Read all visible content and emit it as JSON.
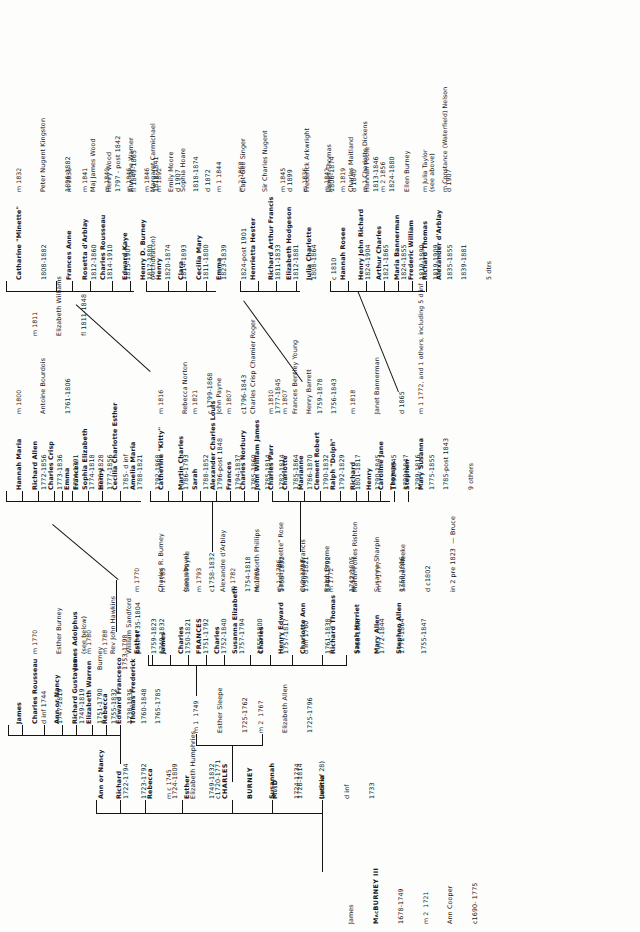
{
  "document": {
    "kind": "genealogical-chart",
    "family": "Burney / MacBurney",
    "orientation": "rotated-90-ccw"
  },
  "root": {
    "name": "James",
    "surname": "MacBURNEY III",
    "dates": "1678-1749",
    "marriage": "m 2  1721",
    "spouse": "Ann Cooper",
    "spouse_dates": "c1690- 1775"
  },
  "gen1": [
    {
      "name": "Letitia",
      "dates": "1733",
      "note": "d inf"
    },
    {
      "name": "Susannah",
      "dates": "1724-1734",
      "note": "(twin of 28)"
    },
    {
      "name": "CHARLES",
      "name2": "BURNEY",
      "name3": "MusD",
      "dates": "1726-1814",
      "smallcaps": true
    },
    {
      "name": "Esther",
      "dates": "1749-1832"
    },
    {
      "name": "Rebecca",
      "dates": "1724-1809"
    },
    {
      "name": "Richard",
      "dates": "1723-1792",
      "marriage": "m c 1745",
      "spouse": "Elizabeth Humphries",
      "spouse_dates": "c1720-1771"
    },
    {
      "name": "Ann or Nancy",
      "dates": "1722-1794"
    }
  ],
  "gen2": [
    {
      "marriage": "m 2  1767",
      "spouse": "Elizabeth Allen",
      "spouse_dates": "1725-1796"
    },
    {
      "marriage": "m 1  1749",
      "spouse": "Esther Sleepe",
      "spouse_dates": "1725-1762"
    }
  ],
  "gen3_left": [
    {
      "name": "Sarah Harriet",
      "dates": "1772-1844"
    },
    {
      "name": "Richard Thomas",
      "dates": "1768-1808"
    },
    {
      "name": "Charlotte Ann",
      "dates": "1761-1838"
    },
    {
      "name": "Henry Edward",
      "dates": "1757-1817",
      "note": "d inf 1760"
    },
    {
      "name": "Charles",
      "dates": "1757-1817"
    },
    {
      "name": "Susanna Elizabeth",
      "dates": "1755-1800"
    },
    {
      "name": "Charles",
      "dates": "1757-1794"
    },
    {
      "name": "FRANCES",
      "dates": "1752-1840",
      "smallcaps": true
    },
    {
      "name": "Charles",
      "dates": "1751-1792"
    },
    {
      "name": "James",
      "dates": "1750-1821"
    },
    {
      "name": "Esther",
      "dates": "1749-1832"
    }
  ],
  "gen3_marriages": [
    {
      "marriage": "m 2  1798",
      "spouse": "Ralph Broome",
      "spouse_dates": "1742-1805"
    },
    {
      "marriage": "m 1  1786",
      "spouse": "Clement Francis",
      "spouse_dates": "1744-1792"
    },
    {
      "marriage": "m 1785",
      "spouse": "Sarah \"Rosette\" Rose",
      "spouse_dates": "1759-1821"
    },
    {
      "marriage": "m 1782",
      "spouse": "Molesworth Phillips",
      "spouse_dates": "1755-1832"
    },
    {
      "marriage": "m 1793",
      "spouse": "Alexandre d'Arblay",
      "spouse_dates": "1754-1818"
    },
    {
      "marriage": "m 1785",
      "spouse": "Sarah Payne",
      "spouse_dates": "c1758-1832"
    },
    {
      "marriage": "m 1770",
      "spouse": "Charles R. Burney",
      "spouse_dates": "(see above)"
    }
  ],
  "gen_mid_left": [
    {
      "name": "Thomas Frederick",
      "dates": "1765-1785"
    },
    {
      "name": "Edward Francesco",
      "dates": "1760-1848"
    },
    {
      "name": "Rebecca",
      "dates": "1738-1835"
    },
    {
      "name": "Elizabeth Warren",
      "dates": "1755-1832"
    },
    {
      "name": "Richard Gustavus",
      "dates": "1751-1790"
    },
    {
      "name": "Ann or Nancy",
      "dates": "1749-1819"
    },
    {
      "name": "Charles Rousseau",
      "dates": "1747-1819"
    },
    {
      "name": "James",
      "note": "d inf 1744"
    }
  ],
  "gen_mid_left_marriages": [
    {
      "marriage": "m 1788",
      "spouse": "William Sandford",
      "spouse_dates": "1759-1823"
    },
    {
      "marriage": "m 1780",
      "spouse": "Rev John Hawkins",
      "spouse_dates": "post 1735-1804"
    },
    {
      "marriage": "m 1770",
      "spouse": "Esther Burney",
      "spouse_dates": "(see below)"
    },
    {
      "marriage": "",
      "spouse": "James Adolphus",
      "spouse_dates": "1753-1798",
      "extra": "Burney"
    }
  ],
  "gen4": [
    {
      "name": "Mary Allen",
      "dates": "1772-1864"
    },
    {
      "name": "Stephen Allen",
      "dates": "1755-1847"
    },
    {
      "name": "Amelia Maria",
      "dates": "1792-1868"
    },
    {
      "name": "Cecilia Charlotte Esther",
      "dates": "1788-1821"
    },
    {
      "name": "Henry",
      "dates": "1785- d inf"
    },
    {
      "name": "Sophia Elizabeth",
      "dates": "1777-1856"
    },
    {
      "name": "Frances",
      "dates": "1776-1828"
    },
    {
      "name": "Charles Parr",
      "dates": "1785-1864"
    },
    {
      "name": "Charlotte",
      "dates": "1786-1870"
    },
    {
      "name": "Marianne",
      "dates": "1790-1832"
    },
    {
      "name": "Clement Robert",
      "dates": "1792-1829"
    },
    {
      "name": "Ralph \"Dolph\"",
      "dates": "1801-1817"
    },
    {
      "name": "Richard",
      "dates": "1790-1845"
    },
    {
      "name": "Henry",
      "dates": "1792-1845"
    },
    {
      "name": "Caroline Jane",
      "dates": "1790-1847"
    },
    {
      "name": "Thomas",
      "dates": "1799-1816"
    },
    {
      "name": "Stephen",
      "dates": "1775-1855"
    },
    {
      "name": "Mary Susanna",
      "dates": "1785-post 1843"
    },
    {
      "name": "Sarah",
      "dates": "1796-post 1848"
    },
    {
      "name": "Martin Charles",
      "dates": "1788-1852"
    },
    {
      "name": "Alexander Charles Louis",
      "dates": "1794-1837"
    },
    {
      "name": "Frances",
      "dates": "1785-1860"
    },
    {
      "name": "Charles Norbury",
      "dates": "1785-1814"
    },
    {
      "name": "John William James",
      "dates": "1782-1814"
    },
    {
      "name": "Catherine \"Kitty\"",
      "dates": "1786-1793"
    },
    {
      "name": "Hannah Maria",
      "dates": "1772-1856"
    },
    {
      "name": "Richard Allen",
      "dates": "1773-1836"
    },
    {
      "name": "Charles Crisp",
      "dates": "1774-1791"
    },
    {
      "name": "Emma",
      "dates": "1774-1818"
    }
  ],
  "gen4_marriages": [
    {
      "marriage": "m 1772",
      "spouse": "Martin Folkes Rishton"
    },
    {
      "marriage": "m 1772",
      "spouse": "Susanna Sharpin",
      "spouse_dates": "1759-1816"
    },
    {
      "marriage": "m 1 1777",
      "spouse": "Samuel Meeke",
      "note2": "in 2 pre 1823  — Bruce",
      "dates2": "d c1802"
    },
    {
      "marriage": "m 1 1772, and 1 others, including 5 d inf",
      "spouse": "9 others"
    },
    {
      "marriage": "m 1818",
      "spouse": "Janet Bannerman",
      "spouse_dates": "d 1865"
    },
    {
      "marriage": "m 1807",
      "spouse": "Henry Barrett",
      "spouse_dates": "1756-1843"
    },
    {
      "marriage": "m 1810",
      "spouse": "Frances Bentley Young",
      "spouse_dates": "1759-1878"
    },
    {
      "marriage": "m 1807",
      "spouse": "Charles Crisp Chamier Roger",
      "spouse_dates": "1777-1845"
    },
    {
      "marriage": "m 1821",
      "spouse": "John Payne",
      "spouse_dates": "c1796-1843"
    },
    {
      "marriage": "m 1816",
      "spouse": "Rebecca Norton",
      "spouse_dates": "c 1799-1868"
    },
    {
      "marriage": "m 1800",
      "spouse": "Antoine Bourdois",
      "spouse_dates": "1761-1806"
    },
    {
      "marriage": "m 1811",
      "spouse": "Elizabeth Williams",
      "spouse_dates": "fl 1811-1848"
    }
  ],
  "gen5": [
    {
      "name": "Hannah Rosee",
      "dates": "1824-1904"
    },
    {
      "name": "Henry John Richard",
      "dates": "1821-1865"
    },
    {
      "name": "Arthur Charles",
      "dates": "1824-1855"
    },
    {
      "name": "Maria Bannerman",
      "dates": "1819-1890"
    },
    {
      "name": "Frederic William",
      "dates": "1819-1909"
    },
    {
      "name": "Richard Thomas",
      "dates": "1835-1855"
    },
    {
      "name": "Alexander d'Arblay",
      "dates": "1839-1881",
      "note": "5 dtrs"
    },
    {
      "name": "Henrietta Hester",
      "dates": "1811-1833"
    },
    {
      "name": "Richard Arthur Francis",
      "dates": "1812-1881"
    },
    {
      "name": "Elizabeth Hodgeson",
      "dates": "1808-1864"
    },
    {
      "name": "Julia Charlotte",
      "dates": "c 1810"
    },
    {
      "name": "Henry D. Burney",
      "dates": "1820-1874"
    },
    {
      "name": "Edward Kaye",
      "dates": "1817-1880"
    },
    {
      "name": "Charles Rousseau",
      "dates": "1815-1907",
      "note": "(Archdeacon)"
    },
    {
      "name": "Frances Anne",
      "dates": "1812-1860"
    },
    {
      "name": "Rosetta d'Arblay",
      "dates": "1814-1910"
    },
    {
      "name": "Catharine \"Minette\"",
      "dates": "1808-1882"
    },
    {
      "name": "Henry",
      "dates": "1814-1893"
    },
    {
      "name": "Clara",
      "dates": "1811-1800"
    },
    {
      "name": "Cecilia Mary",
      "dates": "1823-1839"
    },
    {
      "name": "Emma",
      "dates": "1824-post 1901"
    }
  ],
  "gen5_marriages": [
    {
      "marriage": "m 1819",
      "spouse": "Hannah Poole",
      "spouse_dates": "1824-1880"
    },
    {
      "marriage": "m 1 Charlotte Dickens",
      "spouse": ""
    },
    {
      "marriage": "m 2 1856",
      "spouse": "Ellen Burney",
      "spouse_dates": "(see above)"
    },
    {
      "marriage": "m Julia Taylor",
      "spouse": "d 1907"
    },
    {
      "marriage": "m Constance (Waterfield) Nelson",
      "spouse": ""
    },
    {
      "marriage": "m 1842",
      "spouse": "Charles Maitland",
      "spouse_dates": "1813-1846"
    },
    {
      "marriage": "m 1836",
      "spouse": "James Thomas",
      "spouse_dates": "d 1840"
    },
    {
      "marriage": "m 1845",
      "spouse": "Frederick Arkwright",
      "spouse_dates": "1806-1874"
    },
    {
      "marriage": "m 1846",
      "spouse": "Emily Moore",
      "spouse_dates": "1818-1874"
    },
    {
      "marriage": "m 1840",
      "spouse": "Ann Jane Warner",
      "spouse_dates": "1818-1841"
    },
    {
      "marriage": "m 1846",
      "spouse": "Margaret Carmichael",
      "spouse_dates": "d 1907"
    },
    {
      "marriage": "m 1835",
      "spouse": "Maj James Wood",
      "spouse_dates": "1797 - post 1842"
    },
    {
      "marriage": "m 1841",
      "spouse": "Henry Wood",
      "spouse_dates": "fl 1849-1865"
    },
    {
      "marriage": "m 1832",
      "spouse": "Peter Nugent Kingston",
      "spouse_dates": "1806-1882"
    },
    {
      "marriage": "m 1892",
      "spouse": "Sophia Hoare",
      "spouse_dates": "d 1872"
    },
    {
      "marriage": "m 1 1844",
      "spouse": "Capt Geo Singer"
    },
    {
      "marriage": "m 2 1868",
      "spouse": "Sir Charles Nugent",
      "spouse_dates": "d 1899"
    }
  ]
}
